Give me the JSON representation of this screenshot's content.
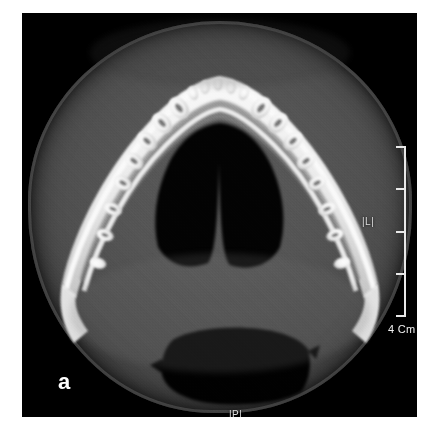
{
  "figure": {
    "panel_label": "a",
    "modality": "axial CT / CBCT slice",
    "region": "mandible dental arch"
  },
  "scan": {
    "background_color": "#000000",
    "soft_tissue_color": "#555555",
    "bone_color": "#f0f0f0",
    "airway_color": "#050505"
  },
  "scale_bar": {
    "label": "4 Cm",
    "length_cm": 4,
    "tick_count": 5,
    "color": "#e8e8e8"
  },
  "orientation_markers": [
    {
      "name": "left",
      "label": "|L|"
    },
    {
      "name": "posterior",
      "label": "|P|"
    }
  ],
  "anatomy": {
    "structures": [
      "mandibular body",
      "dental arch",
      "tooth roots",
      "mandibular symphysis",
      "oropharyngeal airway",
      "sublingual space",
      "soft tissue envelope"
    ]
  }
}
